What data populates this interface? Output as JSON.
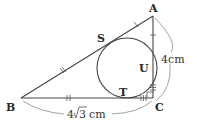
{
  "diagram": {
    "type": "geometry",
    "vertices": {
      "A": {
        "label": "A",
        "x": 153,
        "y": 16
      },
      "B": {
        "label": "B",
        "x": 21,
        "y": 98
      },
      "C": {
        "label": "C",
        "x": 153,
        "y": 98
      }
    },
    "tangent_points": {
      "S": {
        "label": "S",
        "on": "AB"
      },
      "T": {
        "label": "T",
        "on": "BC"
      },
      "U": {
        "label": "U",
        "on": "CA"
      }
    },
    "incircle": {
      "cx": 127,
      "cy": 68,
      "r": 30
    },
    "measurements": {
      "AC": "4cm",
      "BC_prefix": "4",
      "BC_radicand": "3",
      "BC_unit": "cm"
    },
    "tick_marks": {
      "AS_and_AU": 1,
      "BS_and_BT": 2,
      "CT_and_CU": 3
    },
    "right_angle_at": "C",
    "colors": {
      "line": "#444444",
      "arc": "#999999",
      "text": "#2a2a2a"
    }
  }
}
